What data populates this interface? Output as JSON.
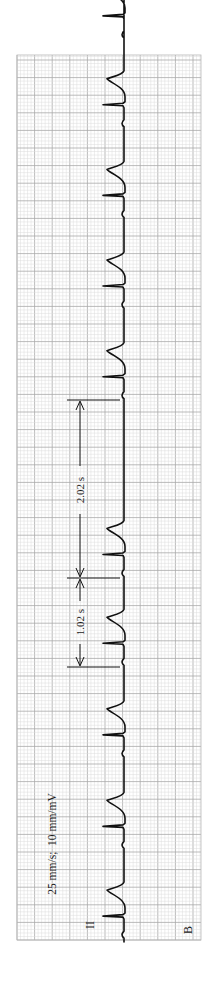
{
  "figure": {
    "panel_label": "B",
    "lead_label": "II",
    "calibration_text": "25 mm/s;  10 mm/mV",
    "interval_short_label": "1.02 s",
    "interval_long_label": "2.02 s",
    "colors": {
      "paper": "#ffffff",
      "grid_minor": "#dcdcdc",
      "grid_major": "#a9a9a9",
      "trace": "#111111"
    }
  },
  "chart_data": {
    "type": "line",
    "orientation": "rotated 90° (time runs bottom-to-top)",
    "paper_speed": "25 mm/s",
    "gain": "10 mm/mV",
    "lead": "II",
    "panel": "B",
    "xlabel": "time (s)",
    "ylabel": "amplitude",
    "grid": true,
    "beats_r_peak_times_s": [
      0.26,
      1.28,
      2.32,
      3.36,
      4.37,
      6.39,
      7.42,
      8.45,
      9.48,
      10.49
    ],
    "annotations": [
      {
        "label": "1.02 s",
        "type": "interval",
        "description": "normal R-R interval"
      },
      {
        "label": "2.02 s",
        "type": "interval",
        "description": "pause, approximately 2× the R-R interval"
      }
    ],
    "observations": "Regular rhythm with ~1.02 s R-R interval (~59 bpm) interrupted by a 2.02 s pause (dropped beat)"
  }
}
